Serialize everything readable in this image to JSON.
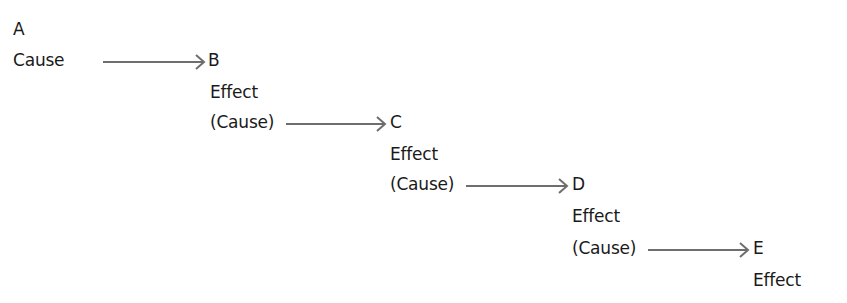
{
  "diagram": {
    "type": "causal-chain",
    "arrow_color": "#6e6e6e",
    "text_color": "#1a1a1a",
    "nodes": [
      {
        "id": "A",
        "letter": "A",
        "roles": [
          "Cause"
        ]
      },
      {
        "id": "B",
        "letter": "B",
        "roles": [
          "Effect",
          "(Cause)"
        ]
      },
      {
        "id": "C",
        "letter": "C",
        "roles": [
          "Effect",
          "(Cause)"
        ]
      },
      {
        "id": "D",
        "letter": "D",
        "roles": [
          "Effect",
          "(Cause)"
        ]
      },
      {
        "id": "E",
        "letter": "E",
        "roles": [
          "Effect"
        ]
      }
    ],
    "edges": [
      {
        "from": "A",
        "to": "B"
      },
      {
        "from": "B",
        "to": "C"
      },
      {
        "from": "C",
        "to": "D"
      },
      {
        "from": "D",
        "to": "E"
      }
    ]
  }
}
